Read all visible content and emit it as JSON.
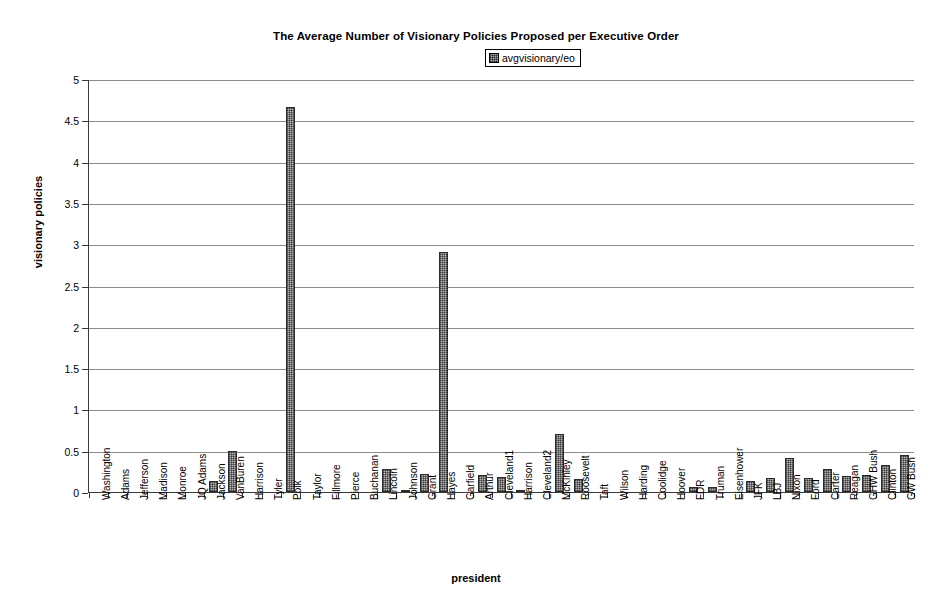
{
  "chart_data": {
    "type": "bar",
    "title": "The Average Number of Visionary Policies Proposed per Executive Order",
    "xlabel": "president",
    "ylabel": "visionary policies",
    "ylim": [
      0,
      5
    ],
    "ytick_step": 0.5,
    "yticks": [
      "5",
      "4.5",
      "4",
      "3.5",
      "3",
      "2.5",
      "2",
      "1.5",
      "1",
      "0.5",
      "0"
    ],
    "grid": true,
    "legend": {
      "position": "top-right",
      "entries": [
        {
          "label": "avgvisionary/eo",
          "swatch": "gray-hatched-square"
        }
      ]
    },
    "series_name": "avgvisionary/eo",
    "categories": [
      "Washington",
      "Adams",
      "Jefferson",
      "Madison",
      "Monroe",
      "JQ Adams",
      "Jackson",
      "VanBuren",
      "Harrison",
      "Tyler",
      "Polk",
      "Taylor",
      "Fillmore",
      "Pierce",
      "Buchanan",
      "Lincoln",
      "Johnson",
      "Grant",
      "Hayes",
      "Garfield",
      "Arthur",
      "Cleveland1",
      "Harrison",
      "Cleveland2",
      "McKinley",
      "Roosevelt",
      "Taft",
      "Wilson",
      "Harding",
      "Coolidge",
      "Hoover",
      "FDR",
      "Truman",
      "Eisenhower",
      "JFK",
      "LBJ",
      "Nixon",
      "Ford",
      "Carter",
      "Reagan",
      "GHW Bush",
      "Clinton",
      "GW Bush"
    ],
    "values": [
      0,
      0,
      0,
      0,
      0,
      0,
      0.13,
      0.5,
      0,
      0,
      4.66,
      0,
      0,
      0,
      0,
      0.28,
      0.02,
      0.22,
      2.9,
      0,
      0.2,
      0.18,
      0.03,
      0,
      0.7,
      0.16,
      0,
      0,
      0,
      0,
      0,
      0.06,
      0.06,
      0,
      0.13,
      0.17,
      0.41,
      0.17,
      0.28,
      0.19,
      0.21,
      0.33,
      0.45
    ]
  },
  "colors": {
    "bar_fill": "#b8b8b8",
    "bar_border": "#2b2b2b",
    "gridline": "#8c8c8c",
    "axis": "#3a3a3a",
    "background": "#ffffff",
    "text": "#000000"
  }
}
